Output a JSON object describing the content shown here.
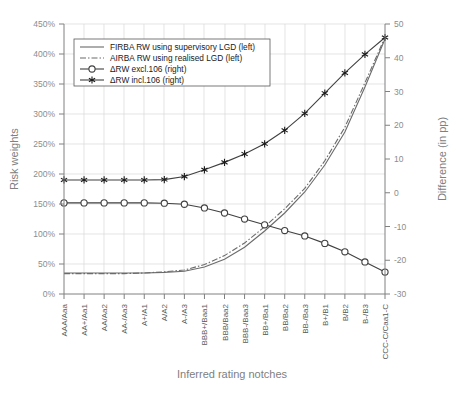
{
  "chart_data": {
    "type": "line",
    "title": "",
    "xlabel": "Inferred rating notches",
    "ylabel": "Risk weights",
    "y2label": "Difference (in pp)",
    "ylim": [
      0,
      450
    ],
    "y2lim": [
      -30,
      50
    ],
    "yticks": [
      "0%",
      "50%",
      "100%",
      "150%",
      "200%",
      "250%",
      "300%",
      "350%",
      "400%",
      "450%"
    ],
    "y2ticks": [
      "-30",
      "-20",
      "-10",
      "0",
      "10",
      "20",
      "30",
      "40",
      "50"
    ],
    "grid": true,
    "legend_position": "upper-left-inside",
    "categories": [
      "AAA/Aaa",
      "AA+/Aa1",
      "AA/Aa2",
      "AA-/Aa3",
      "A+/A1",
      "A/A2",
      "A-/A3",
      "BBB+/Baa1",
      "BBB/Baa2",
      "BBB-/Baa3",
      "BB+/Ba1",
      "BB/Ba2",
      "BB-/Ba3",
      "B+/B1",
      "B/B2",
      "B-/B3",
      "CCC-C/Caa1-C"
    ],
    "series": [
      {
        "name": "FIRBA RW using supervisory LGD (left)",
        "axis": "left",
        "style": "solid",
        "marker": "none",
        "unit": "%",
        "values": [
          35,
          35,
          35,
          35,
          35,
          36,
          38,
          45,
          58,
          78,
          105,
          135,
          170,
          215,
          270,
          345,
          425
        ]
      },
      {
        "name": "AIRBA RW using realised LGD (left)",
        "axis": "left",
        "style": "dash-dot",
        "marker": "none",
        "unit": "%",
        "values": [
          34,
          34,
          34,
          34,
          35,
          37,
          40,
          49,
          64,
          85,
          112,
          142,
          176,
          222,
          278,
          352,
          428
        ]
      },
      {
        "name": "ΔRW excl.106 (right)",
        "axis": "right",
        "style": "solid",
        "marker": "circle",
        "unit": "pp",
        "values": [
          -3.0,
          -3.0,
          -3.0,
          -3.0,
          -3.0,
          -3.1,
          -3.4,
          -4.5,
          -6.0,
          -7.8,
          -9.5,
          -11.2,
          -12.8,
          -15.0,
          -17.5,
          -20.5,
          -23.5
        ]
      },
      {
        "name": "ΔRW incl.106 (right)",
        "axis": "right",
        "style": "solid",
        "marker": "star",
        "unit": "pp",
        "values": [
          3.8,
          3.8,
          3.8,
          3.8,
          3.8,
          3.9,
          4.8,
          6.8,
          9.0,
          11.5,
          14.5,
          18.5,
          23.5,
          29.5,
          35.5,
          41.0,
          46.0
        ]
      }
    ]
  },
  "legend": {
    "entries": [
      {
        "label": "FIRBA RW using supervisory LGD (left)",
        "marker": "line-solid"
      },
      {
        "label": "AIRBA RW using realised LGD (left)",
        "marker": "line-dashdot"
      },
      {
        "label": "ΔRW excl.106 (right)",
        "marker": "line-circle"
      },
      {
        "label": "ΔRW incl.106 (right)",
        "marker": "line-star"
      }
    ]
  },
  "colors": {
    "grid": "#d9d9d9",
    "axis": "#808080",
    "series_light": "#6b6b6b",
    "series_dark": "#404040",
    "text_axis_title": "#808080",
    "text_tick": "#8c8c8c",
    "text_xtick": "#595959",
    "background": "#ffffff"
  }
}
